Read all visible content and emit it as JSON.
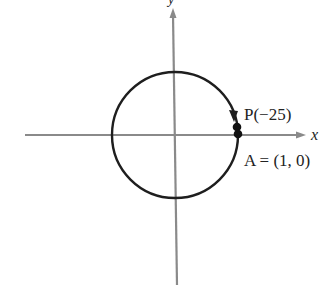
{
  "diagram": {
    "title": "",
    "axes": {
      "x_label": "x",
      "y_label": "y"
    },
    "circle": {
      "type": "unit circle",
      "direction": "clockwise"
    },
    "points": [
      {
        "id": "P",
        "label": "P(−25)"
      },
      {
        "id": "A",
        "label": "A = (1, 0)"
      }
    ]
  },
  "colors": {
    "axis": "#8a8a8a",
    "circle": "#1e1e1e",
    "text": "#222222"
  }
}
